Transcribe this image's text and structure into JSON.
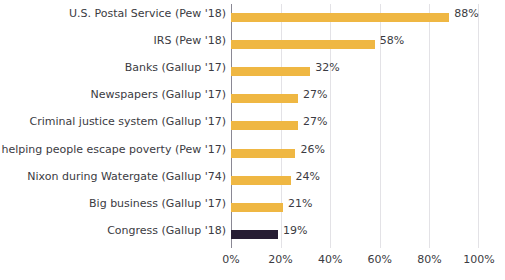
{
  "chart_data": {
    "type": "bar",
    "orientation": "horizontal",
    "title": "",
    "subtitle": "",
    "xlabel": "",
    "ylabel": "",
    "xlim": [
      0,
      100
    ],
    "grid": true,
    "legend": null,
    "value_suffix": "%",
    "colors": {
      "bar": "#efb743",
      "bar_highlight": "#261d33",
      "text": "#3b3b42",
      "gridline": "#e3e2e6",
      "axis": "#8a8894",
      "background": "#ffffff"
    },
    "categories": [
      "U.S. Postal Service (Pew '18)",
      "IRS (Pew '18)",
      "Banks (Gallup '17)",
      "Newspapers (Gallup '17)",
      "Criminal justice system (Gallup '17)",
      "Gov't helping people escape poverty (Pew '17)",
      "Nixon during Watergate (Gallup '74)",
      "Big business (Gallup '17)",
      "Congress (Gallup '18)"
    ],
    "values": [
      88,
      58,
      32,
      27,
      27,
      26,
      24,
      21,
      19
    ],
    "value_labels": [
      "88%",
      "58%",
      "32%",
      "27%",
      "27%",
      "26%",
      "24%",
      "21%",
      "19%"
    ],
    "highlighted_index": 8,
    "xticks": [
      0,
      20,
      40,
      60,
      80,
      100
    ],
    "xtick_labels": [
      "0%",
      "20%",
      "40%",
      "60%",
      "80%",
      "100%"
    ]
  }
}
